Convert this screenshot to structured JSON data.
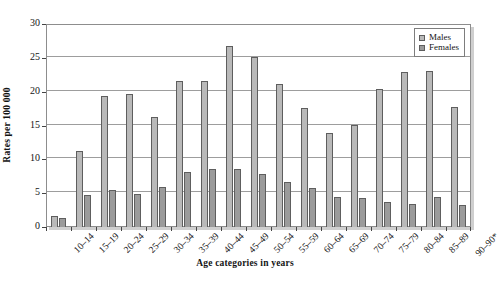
{
  "chart_data": {
    "type": "bar",
    "title": "",
    "subtitle": "",
    "xlabel": "Age categories in years",
    "ylabel": "Rates per 100 000",
    "ylim": [
      0,
      30
    ],
    "yticks": [
      0,
      5,
      10,
      15,
      20,
      25,
      30
    ],
    "ytick_labels": [
      "0",
      "5",
      "10",
      "15",
      "20",
      "25",
      "30"
    ],
    "grid": "horizontal",
    "legend_position": "top-right",
    "bar_grouping": "clustered",
    "categories": [
      "10–14",
      "15–19",
      "20–24",
      "25–29",
      "30–34",
      "35–39",
      "40–44",
      "45–49",
      "50–54",
      "55–59",
      "60–64",
      "65–69",
      "70–74",
      "75–79",
      "80–84",
      "85–89",
      "90–90*"
    ],
    "series": [
      {
        "name": "Males",
        "color": "#b9b9b9",
        "values": [
          1.7,
          11.3,
          19.4,
          19.7,
          16.3,
          21.6,
          21.6,
          26.8,
          25.1,
          21.2,
          17.6,
          13.9,
          15.1,
          20.4,
          22.9,
          23.0,
          17.8
        ]
      },
      {
        "name": "Females",
        "color": "#9b9b9b",
        "values": [
          1.4,
          4.8,
          5.4,
          4.9,
          5.9,
          8.1,
          8.5,
          8.5,
          7.9,
          6.7,
          5.7,
          4.5,
          4.3,
          3.7,
          3.4,
          4.4,
          3.3
        ]
      }
    ]
  },
  "legend": {
    "entries": [
      {
        "label": "Males"
      },
      {
        "label": "Females"
      }
    ]
  }
}
